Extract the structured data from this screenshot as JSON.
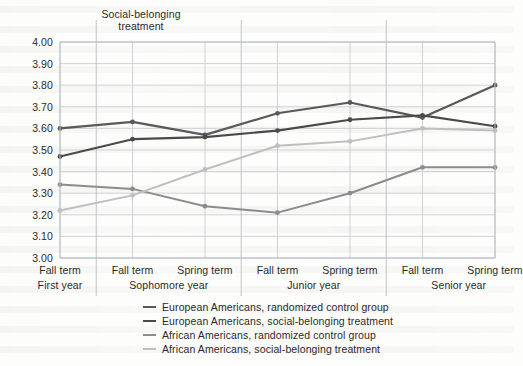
{
  "annotation": {
    "line1": "Social-belonging",
    "line2": "treatment"
  },
  "chart_data": {
    "type": "line",
    "title": "",
    "subtitle": "",
    "xlabel": "",
    "ylabel": "",
    "ylim": [
      3.0,
      4.0
    ],
    "ytick_step": 0.1,
    "yticks": [
      "3.00",
      "3.10",
      "3.20",
      "3.30",
      "3.40",
      "3.50",
      "3.60",
      "3.70",
      "3.80",
      "3.90",
      "4.00"
    ],
    "grid": true,
    "legend_position": "bottom",
    "annotations": [
      {
        "text": "Social-belonging treatment",
        "near_x": "Fall term / First year",
        "position": "above-plot"
      }
    ],
    "categories": [
      "Fall term",
      "Fall term",
      "Spring term",
      "Fall term",
      "Spring term",
      "Fall term",
      "Spring term"
    ],
    "category_groups": [
      {
        "label": "First year",
        "terms": [
          "Fall term"
        ]
      },
      {
        "label": "Sophomore year",
        "terms": [
          "Fall term",
          "Spring term"
        ]
      },
      {
        "label": "Junior year",
        "terms": [
          "Fall term",
          "Spring term"
        ]
      },
      {
        "label": "Senior year",
        "terms": [
          "Fall term",
          "Spring term"
        ]
      }
    ],
    "series": [
      {
        "name": "European Americans, randomized control group",
        "color": "#595959",
        "width": 2.2,
        "values": [
          3.6,
          3.63,
          3.57,
          3.67,
          3.72,
          3.65,
          3.8
        ]
      },
      {
        "name": "European Americans, social-belonging treatment",
        "color": "#4a4a4a",
        "width": 2.2,
        "values": [
          3.47,
          3.55,
          3.56,
          3.59,
          3.64,
          3.66,
          3.61
        ]
      },
      {
        "name": "African Americans, randomized control group",
        "color": "#8c8c8c",
        "width": 2.0,
        "values": [
          3.34,
          3.32,
          3.24,
          3.21,
          3.3,
          3.42,
          3.42
        ]
      },
      {
        "name": "African Americans, social-belonging treatment",
        "color": "#bfbfbf",
        "width": 2.0,
        "values": [
          3.22,
          3.29,
          3.41,
          3.52,
          3.54,
          3.6,
          3.59
        ]
      }
    ]
  },
  "legend": [
    {
      "label": "European Americans, randomized control group",
      "color": "#595959",
      "width": 2.2
    },
    {
      "label": "European Americans, social-belonging treatment",
      "color": "#4a4a4a",
      "width": 2.6
    },
    {
      "label": "African Americans, randomized control group",
      "color": "#8c8c8c",
      "width": 2.0
    },
    {
      "label": "African Americans, social-belonging treatment",
      "color": "#bfbfbf",
      "width": 2.0
    }
  ]
}
